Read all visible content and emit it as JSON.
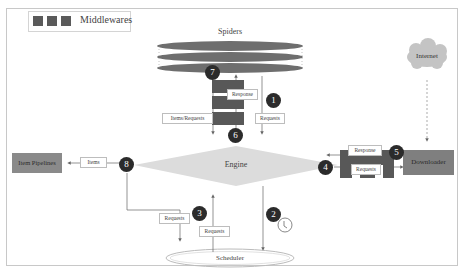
{
  "legend": {
    "label": "Middlewares",
    "swatch_color": "#5a5a5a",
    "swatch_count": 3
  },
  "nodes": {
    "spiders": "Spiders",
    "engine": "Engine",
    "scheduler": "Scheduler",
    "downloader": "Downloader",
    "item_pipelines": "Item Pipelines",
    "internet": "Internet"
  },
  "edge_labels": {
    "response_spider": "Response",
    "items_requests": "Items/Requests",
    "requests_1": "Requests",
    "items": "Items",
    "requests_3": "Requests",
    "requests_sched": "Requests",
    "response_dl": "Response",
    "requests_dl": "Requests"
  },
  "steps": [
    "1",
    "2",
    "3",
    "4",
    "5",
    "6",
    "7",
    "8"
  ],
  "colors": {
    "badge": "#2b2b2b",
    "middleware": "#585858",
    "engine": "#dcdcdc",
    "box": "#8a8a8a",
    "spider_bar": "#6e6e6e",
    "cloud": "#c4c4c4"
  }
}
